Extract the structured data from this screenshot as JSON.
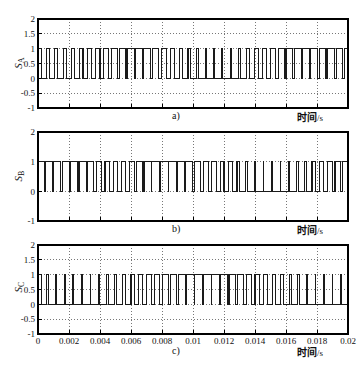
{
  "figure": {
    "background_color": "#ffffff",
    "axis_color": "#000000",
    "grid_color": "#555555",
    "signal_color": "#1a1a1a",
    "width": 363,
    "height": 372
  },
  "chart_data": [
    {
      "type": "line",
      "id": "subplot-a",
      "panel_label": "a)",
      "title": "",
      "subtitle": "",
      "xlabel": "时间/s",
      "ylabel": "S_A",
      "ylabel_text": "S",
      "ylabel_sub": "A",
      "xlim": [
        0,
        0.02
      ],
      "ylim": [
        -1,
        2
      ],
      "grid": true,
      "legend": null,
      "xticks": [
        0,
        0.002,
        0.004,
        0.006,
        0.008,
        0.01,
        0.012,
        0.014,
        0.016,
        0.018,
        0.02
      ],
      "xticklabels": [
        "",
        "",
        "",
        "",
        "",
        "",
        "",
        "",
        "",
        "",
        ""
      ],
      "yticks": [
        -1,
        -0.5,
        0,
        0.5,
        1,
        1.5,
        2
      ],
      "yticklabels": [
        "-1",
        "-0.5",
        "0",
        "0.5",
        "1",
        "1.5",
        "2"
      ],
      "series": [
        {
          "name": "S_A",
          "waveform": "pwm-square",
          "low": 0,
          "high": 1,
          "edges": [
            0.0,
            0.00022,
            0.00055,
            0.00075,
            0.00108,
            0.00128,
            0.00162,
            0.00182,
            0.00215,
            0.00236,
            0.00268,
            0.0029,
            0.0032,
            0.00345,
            0.00372,
            0.004,
            0.00424,
            0.00455,
            0.00474,
            0.00512,
            0.00524,
            0.00568,
            0.00576,
            0.00622,
            0.00628,
            0.00676,
            0.00682,
            0.00728,
            0.00738,
            0.0078,
            0.00795,
            0.0083,
            0.00852,
            0.00882,
            0.0091,
            0.00932,
            0.00968,
            0.00984,
            0.01024,
            0.01035,
            0.01078,
            0.01086,
            0.01132,
            0.01138,
            0.01186,
            0.01192,
            0.0124,
            0.01248,
            0.01292,
            0.01305,
            0.01344,
            0.01362,
            0.01395,
            0.0142,
            0.01446,
            0.01476,
            0.01498,
            0.01532,
            0.01549,
            0.01588,
            0.016,
            0.01644,
            0.01652,
            0.01698,
            0.01704,
            0.01752,
            0.01758,
            0.01806,
            0.01814,
            0.01858,
            0.0187,
            0.0191,
            0.01926,
            0.01962,
            0.0198,
            0.02
          ]
        }
      ]
    },
    {
      "type": "line",
      "id": "subplot-b",
      "panel_label": "b)",
      "title": "",
      "subtitle": "",
      "xlabel": "时间/s",
      "ylabel": "S_B",
      "ylabel_text": "S",
      "ylabel_sub": "B",
      "xlim": [
        0,
        0.02
      ],
      "ylim": [
        -1,
        2
      ],
      "grid": true,
      "legend": null,
      "xticks": [
        0,
        0.002,
        0.004,
        0.006,
        0.008,
        0.01,
        0.012,
        0.014,
        0.016,
        0.018,
        0.02
      ],
      "xticklabels": [
        "",
        "",
        "",
        "",
        "",
        "",
        "",
        "",
        "",
        "",
        ""
      ],
      "yticks": [
        -1,
        0,
        1,
        2
      ],
      "yticklabels": [
        "-1",
        "0",
        "1",
        "2"
      ],
      "series": [
        {
          "name": "S_B",
          "waveform": "pwm-square",
          "low": 0,
          "high": 1,
          "edges": [
            0.0,
            0.0004,
            0.00048,
            0.00092,
            0.001,
            0.00148,
            0.00156,
            0.00204,
            0.00212,
            0.00258,
            0.00268,
            0.0031,
            0.00322,
            0.0036,
            0.00376,
            0.0041,
            0.00432,
            0.0046,
            0.00486,
            0.00512,
            0.00538,
            0.00566,
            0.00588,
            0.0062,
            0.00636,
            0.00676,
            0.00684,
            0.0073,
            0.00734,
            0.00784,
            0.00788,
            0.0084,
            0.00842,
            0.00894,
            0.00898,
            0.00946,
            0.00954,
            0.00998,
            0.0101,
            0.0105,
            0.01066,
            0.011,
            0.01122,
            0.0115,
            0.01176,
            0.012,
            0.0123,
            0.01252,
            0.01284,
            0.01302,
            0.0134,
            0.01352,
            0.01396,
            0.01402,
            0.01452,
            0.01456,
            0.01508,
            0.0151,
            0.01562,
            0.01566,
            0.01616,
            0.01622,
            0.01668,
            0.01678,
            0.01718,
            0.01732,
            0.01768,
            0.01788,
            0.01816,
            0.01844,
            0.01866,
            0.01898,
            0.01916,
            0.01952,
            0.01966,
            0.02
          ]
        }
      ]
    },
    {
      "type": "line",
      "id": "subplot-c",
      "panel_label": "c)",
      "title": "",
      "subtitle": "",
      "xlabel": "时间/s",
      "ylabel": "S_C",
      "ylabel_text": "S",
      "ylabel_sub": "C",
      "xlim": [
        0,
        0.02
      ],
      "ylim": [
        -1,
        2
      ],
      "grid": true,
      "legend": null,
      "xticks": [
        0,
        0.002,
        0.004,
        0.006,
        0.008,
        0.01,
        0.012,
        0.014,
        0.016,
        0.018,
        0.02
      ],
      "xticklabels": [
        "0",
        "0.002",
        "0.004",
        "0.006",
        "0.008",
        "0.01",
        "0.012",
        "0.014",
        "0.016",
        "0.018",
        "0.02"
      ],
      "yticks": [
        -1,
        -0.5,
        0,
        0.5,
        1,
        1.5,
        2
      ],
      "yticklabels": [
        "-1",
        "-0.5",
        "0",
        "0.5",
        "1",
        "1.5",
        "2"
      ],
      "series": [
        {
          "name": "S_C",
          "waveform": "pwm-square",
          "low": 0,
          "high": 1,
          "edges": [
            0.0,
            0.0002,
            0.00056,
            0.00068,
            0.00114,
            0.00122,
            0.0017,
            0.00176,
            0.00226,
            0.0023,
            0.00282,
            0.00284,
            0.00336,
            0.0034,
            0.0039,
            0.00396,
            0.00444,
            0.00452,
            0.00496,
            0.00508,
            0.00548,
            0.00564,
            0.006,
            0.0062,
            0.0065,
            0.00676,
            0.00702,
            0.0073,
            0.00754,
            0.00786,
            0.00804,
            0.0084,
            0.00856,
            0.00896,
            0.00908,
            0.00952,
            0.00958,
            0.01008,
            0.01012,
            0.01064,
            0.01066,
            0.01118,
            0.0112,
            0.01172,
            0.01176,
            0.01224,
            0.01232,
            0.01276,
            0.01288,
            0.01328,
            0.01344,
            0.0138,
            0.014,
            0.0143,
            0.01456,
            0.01482,
            0.0151,
            0.01534,
            0.01566,
            0.01584,
            0.0162,
            0.01636,
            0.01676,
            0.01688,
            0.01732,
            0.0174,
            0.01788,
            0.01792,
            0.01844,
            0.01846,
            0.01898,
            0.019,
            0.01952,
            0.01956,
            0.02
          ]
        }
      ]
    }
  ]
}
